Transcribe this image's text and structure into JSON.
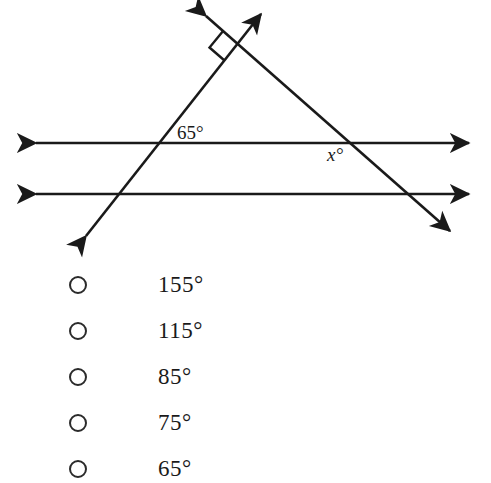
{
  "figure": {
    "name": "parallel-lines-transversals-diagram",
    "stroke_color": "#1a1a1a",
    "background_color": "#ffffff",
    "labels": {
      "angle_known": "65°",
      "angle_unknown": "x°"
    },
    "elements": {
      "upper_parallel_line": "horizontal double-headed arrow line",
      "lower_parallel_line": "horizontal double-headed arrow line",
      "transversal_ascending": "double-headed arrow from lower-left to upper-right",
      "transversal_descending": "double-headed arrow from upper-left to lower-right",
      "right_angle_mark": "square marker at apex vertex"
    }
  },
  "choices": [
    {
      "id": "choice-1",
      "label": "155°",
      "selected": false
    },
    {
      "id": "choice-2",
      "label": "115°",
      "selected": false
    },
    {
      "id": "choice-3",
      "label": "85°",
      "selected": false
    },
    {
      "id": "choice-4",
      "label": "75°",
      "selected": false
    },
    {
      "id": "choice-5",
      "label": "65°",
      "selected": false
    }
  ]
}
